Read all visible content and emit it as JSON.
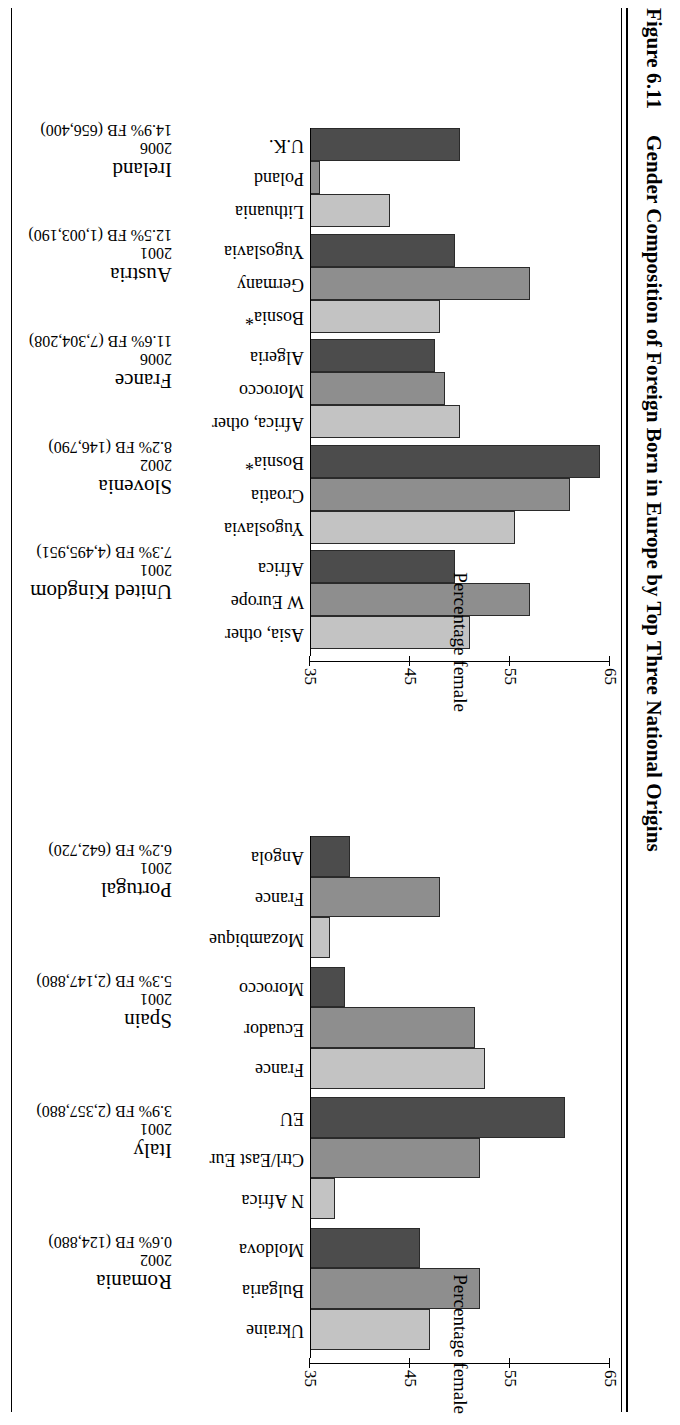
{
  "figure": {
    "number": "Figure 6.11",
    "title": "Gender Composition of Foreign Born in Europe by Top Three National Origins"
  },
  "axis": {
    "ylabel": "Percentage female",
    "ticks": [
      "35",
      "45",
      "55",
      "65"
    ],
    "min": 35,
    "max": 65
  },
  "series_colors": {
    "first": "#4c4c4c",
    "second": "#8e8e8e",
    "third": "#c3c3c3"
  },
  "chart_data": {
    "type": "bar",
    "title": "Gender Composition of Foreign Born in Europe by Top Three National Origins",
    "xlabel": "",
    "ylabel": "Percentage female",
    "ylim": [
      35,
      65
    ],
    "grid": false,
    "legend": "none",
    "note": "Two panels of grouped bars; each country panel shows its top three national origins. Bars shaded dark / medium / light grey for origin 1 / 2 / 3.",
    "panels": [
      {
        "name": "panel-left",
        "groups": [
          {
            "country": "Ireland",
            "year": "2006",
            "fb": "14.9% FB (656,400)",
            "categories": [
              "U.K.",
              "Poland",
              "Lithuania"
            ],
            "values": [
              50,
              36,
              43
            ]
          },
          {
            "country": "Austria",
            "year": "2001",
            "fb": "12.5% FB (1,003,190)",
            "categories": [
              "Yugoslavia",
              "Germany",
              "Bosnia*"
            ],
            "values": [
              49.5,
              57,
              48
            ]
          },
          {
            "country": "France",
            "year": "2006",
            "fb": "11.6% FB (7,304,208)",
            "categories": [
              "Algeria",
              "Morocco",
              "Africa, other"
            ],
            "values": [
              47.5,
              48.5,
              50
            ]
          },
          {
            "country": "Slovenia",
            "year": "2002",
            "fb": "8.2% FB (146,790)",
            "categories": [
              "Bosnia*",
              "Croatia",
              "Yugoslavia"
            ],
            "values": [
              64,
              61,
              55.5
            ]
          },
          {
            "country": "United Kingdom",
            "year": "2001",
            "fb": "7.3% FB (4,495,951)",
            "categories": [
              "Africa",
              "W Europe",
              "Asia, other"
            ],
            "values": [
              49.5,
              57,
              51
            ]
          }
        ]
      },
      {
        "name": "panel-right",
        "groups": [
          {
            "country": "Portugal",
            "year": "2001",
            "fb": "6.2% FB (642,720)",
            "categories": [
              "Angola",
              "France",
              "Mozambique"
            ],
            "values": [
              39,
              48,
              37
            ]
          },
          {
            "country": "Spain",
            "year": "2001",
            "fb": "5.3% FB (2,147,880)",
            "categories": [
              "Morocco",
              "Ecuador",
              "France"
            ],
            "values": [
              38.5,
              51.5,
              52.5
            ]
          },
          {
            "country": "Italy",
            "year": "2001",
            "fb": "3.9% FB (2,357,880)",
            "categories": [
              "EU",
              "Ctrl/East Eur",
              "N Africa"
            ],
            "values": [
              60.5,
              52,
              37.5
            ]
          },
          {
            "country": "Romania",
            "year": "2002",
            "fb": "0.6% FB (124,880)",
            "categories": [
              "Moldova",
              "Bulgaria",
              "Ukraine"
            ],
            "values": [
              46,
              52,
              47
            ]
          }
        ]
      }
    ]
  }
}
